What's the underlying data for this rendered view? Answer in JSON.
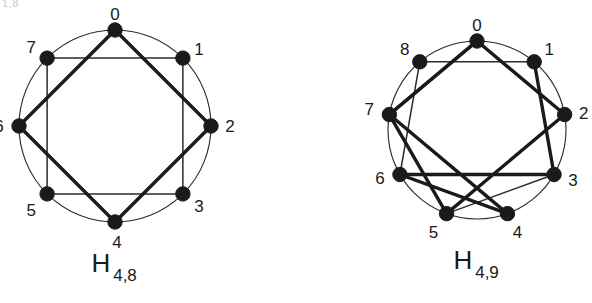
{
  "figure": {
    "artifact_text": "1,8",
    "background": "#ffffff",
    "ink_color": "#1a1a1a",
    "thin_stroke_color": "#2b2b2b",
    "thick_stroke_color": "#1a1a1a"
  },
  "graphs": [
    {
      "id": "H_4_8",
      "label_main": "H",
      "label_sub": "4,8",
      "n": 8,
      "center": {
        "x": 115,
        "y": 126
      },
      "radius": 96,
      "start_angle_deg": -90,
      "vertex_labels": [
        "0",
        "1",
        "2",
        "3",
        "4",
        "5",
        "6",
        "7"
      ],
      "label_offsets": [
        {
          "dx": 0,
          "dy": -14
        },
        {
          "dx": 16,
          "dy": -8
        },
        {
          "dx": 19,
          "dy": 2
        },
        {
          "dx": 16,
          "dy": 14
        },
        {
          "dx": 2,
          "dy": 22
        },
        {
          "dx": -16,
          "dy": 18
        },
        {
          "dx": -20,
          "dy": 2
        },
        {
          "dx": -16,
          "dy": -10
        }
      ],
      "edges_thin": [
        [
          7,
          1
        ],
        [
          1,
          3
        ],
        [
          3,
          5
        ],
        [
          5,
          7
        ]
      ],
      "edges_thick": [
        [
          0,
          2
        ],
        [
          2,
          4
        ],
        [
          4,
          6
        ],
        [
          6,
          0
        ]
      ]
    },
    {
      "id": "H_4_9",
      "label_main": "H",
      "label_sub": "4,9",
      "n": 9,
      "center": {
        "x": 477,
        "y": 130
      },
      "radius": 89,
      "start_angle_deg": -90,
      "vertex_labels": [
        "0",
        "1",
        "2",
        "3",
        "4",
        "5",
        "6",
        "7",
        "8"
      ],
      "label_offsets": [
        {
          "dx": 0,
          "dy": -14
        },
        {
          "dx": 15,
          "dy": -11
        },
        {
          "dx": 19,
          "dy": 0
        },
        {
          "dx": 19,
          "dy": 7
        },
        {
          "dx": 10,
          "dy": 20
        },
        {
          "dx": -13,
          "dy": 20
        },
        {
          "dx": -20,
          "dy": 5
        },
        {
          "dx": -20,
          "dy": -4
        },
        {
          "dx": -15,
          "dy": -11
        }
      ],
      "edges_thin": [
        [
          8,
          1
        ],
        [
          1,
          3
        ],
        [
          8,
          6
        ],
        [
          6,
          4
        ],
        [
          3,
          5
        ]
      ],
      "edges_thick": [
        [
          0,
          2
        ],
        [
          2,
          5
        ],
        [
          5,
          7
        ],
        [
          7,
          0
        ],
        [
          0,
          7
        ],
        [
          7,
          4
        ],
        [
          4,
          6
        ],
        [
          6,
          3
        ],
        [
          3,
          1
        ]
      ]
    }
  ]
}
